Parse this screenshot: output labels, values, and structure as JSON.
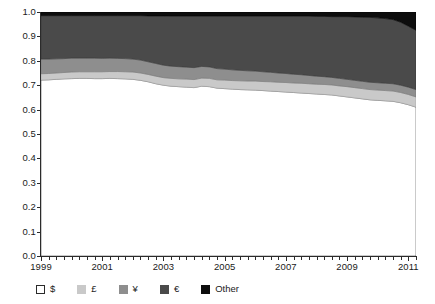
{
  "chart_data": {
    "type": "area",
    "title": "",
    "subtitle": "",
    "xlabel": "",
    "ylabel": "",
    "stacked": true,
    "normalized": true,
    "grid": false,
    "legend_position": "bottom",
    "xlim": [
      1999,
      2011.25
    ],
    "ylim": [
      0.0,
      1.0
    ],
    "x_tick_labels": [
      "1999",
      "2001",
      "2003",
      "2005",
      "2007",
      "2009",
      "2011"
    ],
    "x_tick_values": [
      1999,
      2001,
      2003,
      2005,
      2007,
      2009,
      2011
    ],
    "x_minor_tick_step": 0.25,
    "y_tick_labels": [
      "0.0",
      "0.1",
      "0.2",
      "0.3",
      "0.4",
      "0.5",
      "0.6",
      "0.7",
      "0.8",
      "0.9",
      "1.0"
    ],
    "y_tick_values": [
      0.0,
      0.1,
      0.2,
      0.3,
      0.4,
      0.5,
      0.6,
      0.7,
      0.8,
      0.9,
      1.0
    ],
    "x": [
      1999.0,
      1999.25,
      1999.5,
      1999.75,
      2000.0,
      2000.25,
      2000.5,
      2000.75,
      2001.0,
      2001.25,
      2001.5,
      2001.75,
      2002.0,
      2002.25,
      2002.5,
      2002.75,
      2003.0,
      2003.25,
      2003.5,
      2003.75,
      2004.0,
      2004.25,
      2004.5,
      2004.75,
      2005.0,
      2005.25,
      2005.5,
      2005.75,
      2006.0,
      2006.25,
      2006.5,
      2006.75,
      2007.0,
      2007.25,
      2007.5,
      2007.75,
      2008.0,
      2008.25,
      2008.5,
      2008.75,
      2009.0,
      2009.25,
      2009.5,
      2009.75,
      2010.0,
      2010.25,
      2010.5,
      2010.75,
      2011.0,
      2011.25
    ],
    "series": [
      {
        "name": "$",
        "symbol": "$",
        "color": "#ffffff",
        "border": "#2b2b2b",
        "values": [
          0.721,
          0.722,
          0.724,
          0.726,
          0.727,
          0.728,
          0.728,
          0.727,
          0.727,
          0.728,
          0.727,
          0.726,
          0.724,
          0.72,
          0.714,
          0.706,
          0.7,
          0.696,
          0.694,
          0.692,
          0.69,
          0.696,
          0.694,
          0.688,
          0.686,
          0.684,
          0.682,
          0.681,
          0.68,
          0.678,
          0.676,
          0.674,
          0.672,
          0.67,
          0.668,
          0.666,
          0.664,
          0.662,
          0.66,
          0.656,
          0.652,
          0.648,
          0.644,
          0.64,
          0.638,
          0.636,
          0.634,
          0.628,
          0.62,
          0.61
        ]
      },
      {
        "name": "£",
        "symbol": "£",
        "color": "#c9c9c9",
        "border": "#9a9a9a",
        "values": [
          0.026,
          0.026,
          0.026,
          0.026,
          0.027,
          0.027,
          0.027,
          0.028,
          0.028,
          0.028,
          0.029,
          0.029,
          0.03,
          0.03,
          0.03,
          0.031,
          0.031,
          0.032,
          0.032,
          0.033,
          0.033,
          0.033,
          0.034,
          0.034,
          0.035,
          0.035,
          0.036,
          0.036,
          0.037,
          0.037,
          0.038,
          0.038,
          0.039,
          0.039,
          0.04,
          0.04,
          0.04,
          0.041,
          0.041,
          0.041,
          0.042,
          0.042,
          0.042,
          0.042,
          0.042,
          0.042,
          0.042,
          0.042,
          0.042,
          0.042
        ]
      },
      {
        "name": "¥",
        "symbol": "¥",
        "color": "#8e8e8e",
        "border": "#6e6e6e",
        "values": [
          0.06,
          0.059,
          0.058,
          0.057,
          0.057,
          0.056,
          0.056,
          0.056,
          0.055,
          0.055,
          0.054,
          0.054,
          0.053,
          0.053,
          0.052,
          0.052,
          0.051,
          0.05,
          0.05,
          0.049,
          0.049,
          0.048,
          0.047,
          0.046,
          0.045,
          0.044,
          0.043,
          0.042,
          0.041,
          0.04,
          0.039,
          0.038,
          0.037,
          0.036,
          0.035,
          0.034,
          0.033,
          0.032,
          0.031,
          0.031,
          0.03,
          0.03,
          0.03,
          0.03,
          0.03,
          0.03,
          0.03,
          0.03,
          0.03,
          0.03
        ]
      },
      {
        "name": "€",
        "symbol": "€",
        "color": "#4a4a4a",
        "border": "#333333",
        "values": [
          0.178,
          0.178,
          0.177,
          0.176,
          0.174,
          0.174,
          0.174,
          0.174,
          0.175,
          0.174,
          0.175,
          0.176,
          0.178,
          0.182,
          0.188,
          0.195,
          0.202,
          0.205,
          0.207,
          0.209,
          0.211,
          0.206,
          0.208,
          0.215,
          0.217,
          0.22,
          0.222,
          0.224,
          0.225,
          0.228,
          0.23,
          0.233,
          0.235,
          0.238,
          0.24,
          0.243,
          0.245,
          0.247,
          0.249,
          0.253,
          0.257,
          0.26,
          0.263,
          0.266,
          0.266,
          0.265,
          0.263,
          0.258,
          0.25,
          0.243
        ]
      },
      {
        "name": "Other",
        "symbol": "Other",
        "color": "#0d0d0d",
        "border": "#000000",
        "values": [
          0.015,
          0.015,
          0.015,
          0.015,
          0.015,
          0.015,
          0.015,
          0.015,
          0.015,
          0.015,
          0.015,
          0.015,
          0.015,
          0.015,
          0.016,
          0.016,
          0.016,
          0.017,
          0.017,
          0.017,
          0.017,
          0.017,
          0.017,
          0.017,
          0.017,
          0.017,
          0.017,
          0.017,
          0.017,
          0.017,
          0.017,
          0.017,
          0.017,
          0.017,
          0.017,
          0.017,
          0.018,
          0.018,
          0.019,
          0.019,
          0.019,
          0.02,
          0.021,
          0.022,
          0.024,
          0.027,
          0.031,
          0.042,
          0.058,
          0.075
        ]
      }
    ]
  },
  "legend": {
    "items": [
      {
        "label": "$",
        "swatch": "white-swatch"
      },
      {
        "label": "£",
        "swatch": "light-gray-swatch"
      },
      {
        "label": "¥",
        "swatch": "medium-gray-swatch"
      },
      {
        "label": "€",
        "swatch": "dark-gray-swatch"
      },
      {
        "label": "Other",
        "swatch": "black-swatch"
      }
    ]
  },
  "colors": {
    "dollar": "#ffffff",
    "pound": "#c9c9c9",
    "yen": "#8e8e8e",
    "euro": "#4a4a4a",
    "other": "#0d0d0d",
    "axis": "#2b2b2b",
    "text": "#1a1a1a",
    "background": "#ffffff"
  }
}
